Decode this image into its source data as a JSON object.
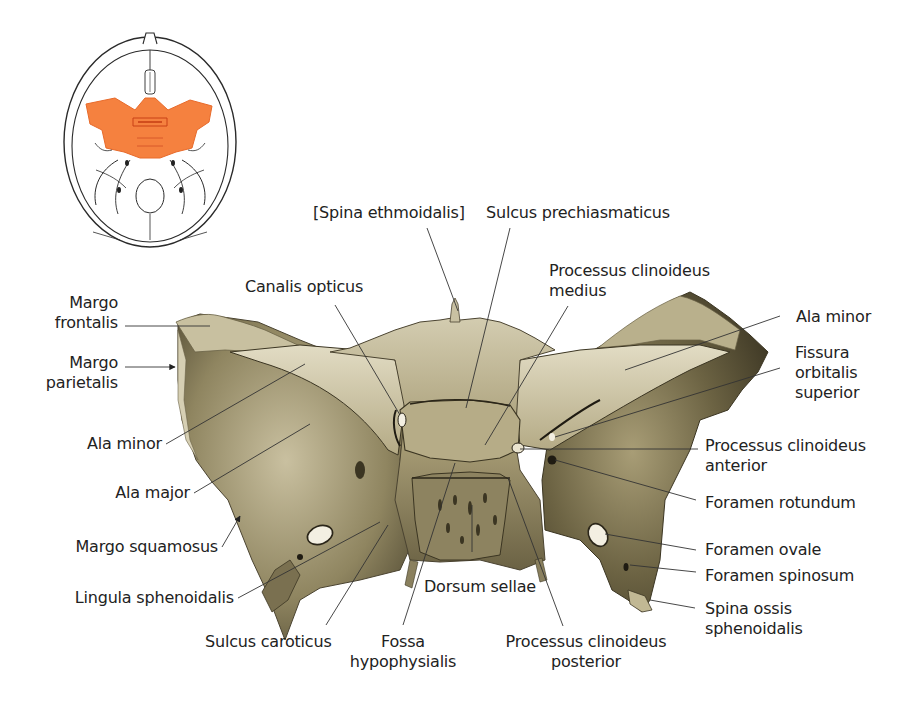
{
  "figure": {
    "inset": {
      "description": "Skull base top view with sphenoid highlighted",
      "highlight_color": "#f5813f",
      "outline_color": "#2a2a2a"
    },
    "bone_colors": {
      "light": "#d8d2b8",
      "mid": "#a59a72",
      "dark": "#5a5236",
      "shadow": "#3b3522"
    },
    "labels": {
      "spina_ethmoidalis": "[Spina ethmoidalis]",
      "sulcus_prechiasmaticus": "Sulcus prechiasmaticus",
      "processus_clinoideus_medius": "Processus clinoideus\nmedius",
      "canalis_opticus": "Canalis opticus",
      "margo_frontalis": "Margo\nfrontalis",
      "margo_parietalis": "Margo\nparietalis",
      "ala_minor_left": "Ala minor",
      "ala_major": "Ala major",
      "margo_squamosus": "Margo squamosus",
      "lingula_sphenoidalis": "Lingula sphenoidalis",
      "sulcus_caroticus": "Sulcus caroticus",
      "fossa_hypophysialis": "Fossa\nhypophysialis",
      "dorsum_sellae": "Dorsum sellae",
      "processus_clinoideus_posterior": "Processus clinoideus\nposterior",
      "ala_minor_right": "Ala minor",
      "fissura_orbitalis_superior": "Fissura\norbitalis\nsuperior",
      "processus_clinoideus_anterior": "Processus clinoideus\nanterior",
      "foramen_rotundum": "Foramen rotundum",
      "foramen_ovale": "Foramen ovale",
      "foramen_spinosum": "Foramen spinosum",
      "spina_ossis_sphenoidalis": "Spina ossis\nsphenoidalis"
    }
  }
}
